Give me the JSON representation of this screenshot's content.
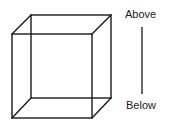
{
  "diagram": {
    "type": "necker-cube",
    "stroke_color": "#1a1a1a",
    "background": "#ffffff",
    "cube": {
      "front_face": {
        "top_left": [
          12,
          34
        ],
        "top_right": [
          92,
          34
        ],
        "bottom_right": [
          92,
          118
        ],
        "bottom_left": [
          12,
          118
        ]
      },
      "back_face": {
        "top_left": [
          31,
          15
        ],
        "top_right": [
          111,
          15
        ],
        "bottom_right": [
          111,
          98
        ],
        "bottom_left": [
          31,
          98
        ]
      }
    },
    "axis": {
      "top_label": "Above",
      "bottom_label": "Below",
      "line": {
        "x": 142,
        "y1": 27,
        "y2": 94
      }
    }
  }
}
